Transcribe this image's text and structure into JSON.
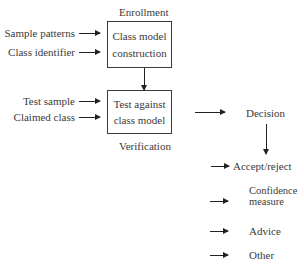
{
  "enrollment": {
    "title": "Enrollment",
    "inputs": [
      "Sample patterns",
      "Class identifier"
    ],
    "box": [
      "Class model",
      "construction"
    ]
  },
  "verification": {
    "title": "Verification",
    "inputs": [
      "Test sample",
      "Claimed class"
    ],
    "box": [
      "Test against",
      "class model"
    ]
  },
  "decision": {
    "label": "Decision",
    "outputs": [
      "Accept/reject",
      "Confidence",
      "measure",
      "Advice",
      "Other"
    ]
  }
}
